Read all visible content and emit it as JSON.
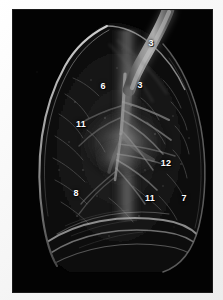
{
  "figure": {
    "name": "lateral-chest-scan",
    "background_color": "#030303",
    "margin_color": "#f4f4f4",
    "label_color": "#ffffff",
    "trachea_color": "#8a8a8a",
    "vessel_color": "#9a9a9a",
    "pleura_color": "#c8c8c8"
  },
  "annotations": [
    {
      "id": "label-3-trachea-upper",
      "text": "3",
      "x": 138,
      "y": 33
    },
    {
      "id": "label-3-trachea-lower",
      "text": "3",
      "x": 127,
      "y": 75
    },
    {
      "id": "label-6",
      "text": "6",
      "x": 90,
      "y": 76
    },
    {
      "id": "label-11-upper-left",
      "text": "11",
      "x": 68,
      "y": 114
    },
    {
      "id": "label-12",
      "text": "12",
      "x": 153,
      "y": 153
    },
    {
      "id": "label-8",
      "text": "8",
      "x": 63,
      "y": 183
    },
    {
      "id": "label-11-lower",
      "text": "11",
      "x": 137,
      "y": 188
    },
    {
      "id": "label-7",
      "text": "7",
      "x": 171,
      "y": 188
    }
  ]
}
